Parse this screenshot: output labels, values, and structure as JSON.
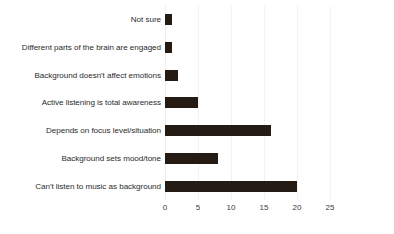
{
  "chart_data": {
    "type": "bar",
    "orientation": "horizontal",
    "title": "",
    "subtitle": "",
    "xlabel": "",
    "ylabel": "",
    "xlim": [
      0,
      25
    ],
    "xticks": [
      0,
      5,
      10,
      15,
      20,
      25
    ],
    "xtick_labels": [
      "0",
      "5",
      "10",
      "15",
      "20",
      "25"
    ],
    "grid": true,
    "grid_axis": "x",
    "legend": false,
    "legend_position": "none",
    "bar_color": "#241b14",
    "gridline_color": "#f2f2f2",
    "background_color": "#ffffff",
    "categories": [
      "Not sure",
      "Different parts of the brain are engaged",
      "Background doesn't affect emotions",
      "Active listening is total awareness",
      "Depends on focus level/situation",
      "Background sets mood/tone",
      "Can't listen to music as background"
    ],
    "values": [
      1,
      1,
      2,
      5,
      16,
      8,
      20
    ]
  }
}
